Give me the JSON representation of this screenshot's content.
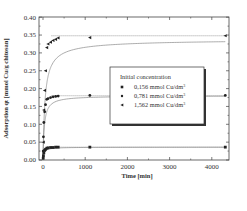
{
  "chart_data": {
    "type": "line",
    "title": "",
    "xlabel": "Time [min]",
    "ylabel": "Adsorption q_t [mmol Cu/g chitosan]",
    "xlim": [
      -100,
      4400
    ],
    "ylim": [
      0.0,
      0.4
    ],
    "xticks": [
      0,
      1000,
      2000,
      3000,
      4000
    ],
    "xtick_labels": [
      "0",
      "1000",
      "2000",
      "3000",
      "4000"
    ],
    "yticks": [
      0.0,
      0.05,
      0.1,
      0.15,
      0.2,
      0.25,
      0.3,
      0.35,
      0.4
    ],
    "ytick_labels": [
      "0.00",
      "0.05",
      "0.10",
      "0.15",
      "0.20",
      "0.25",
      "0.30",
      "0.35",
      "0.40"
    ],
    "grid": false,
    "legend": {
      "title": "Initial concentration",
      "position": "center-right",
      "entries": [
        "0,156 mmol Cu/dm3",
        "0,781 mmol Cu/dm3",
        "1,562 mmol Cu/dm3"
      ]
    },
    "series": [
      {
        "name": "0,156 mmol Cu/dm3",
        "marker": "square",
        "x": [
          5,
          10,
          20,
          40,
          60,
          90,
          120,
          180,
          240,
          300,
          360,
          1110,
          4320
        ],
        "y": [
          0.005,
          0.012,
          0.02,
          0.027,
          0.03,
          0.033,
          0.034,
          0.035,
          0.035,
          0.036,
          0.036,
          0.036,
          0.036
        ],
        "fit_plateau": 0.036
      },
      {
        "name": "0,781 mmol Cu/dm3",
        "marker": "circle",
        "x": [
          5,
          10,
          20,
          40,
          60,
          90,
          120,
          180,
          240,
          300,
          360,
          1110,
          4320
        ],
        "y": [
          0.025,
          0.065,
          0.105,
          0.135,
          0.155,
          0.17,
          0.172,
          0.175,
          0.177,
          0.178,
          0.179,
          0.181,
          0.181
        ],
        "fit_plateau": 0.18
      },
      {
        "name": "1,562 mmol Cu/dm3",
        "marker": "triangle-left",
        "x": [
          10,
          20,
          40,
          60,
          90,
          120,
          180,
          240,
          300,
          360,
          1110,
          4320
        ],
        "y": [
          0.05,
          0.14,
          0.195,
          0.25,
          0.315,
          0.325,
          0.33,
          0.335,
          0.338,
          0.342,
          0.343,
          0.348
        ],
        "fit_plateau": 0.348
      }
    ]
  }
}
